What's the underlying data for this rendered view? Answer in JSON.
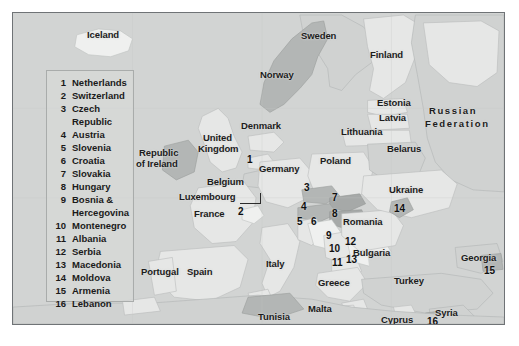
{
  "figure": {
    "type": "reference-map",
    "region": "Europe, North Africa and Western Asia",
    "frame_color": "#6f7376",
    "sea_color": "#d2d4d3",
    "land_light_color": "#e4e5e4",
    "land_mid_color": "#cfd1d0",
    "land_dark_color": "#b4b7b6",
    "label_color": "#1c1c1c"
  },
  "legend": {
    "border_color": "#a9acab",
    "entries": [
      {
        "number": "1",
        "name": "Netherlands",
        "continuation": ""
      },
      {
        "number": "2",
        "name": "Switzerland",
        "continuation": ""
      },
      {
        "number": "3",
        "name": "Czech",
        "continuation": "Republic"
      },
      {
        "number": "4",
        "name": "Austria",
        "continuation": ""
      },
      {
        "number": "5",
        "name": "Slovenia",
        "continuation": ""
      },
      {
        "number": "6",
        "name": "Croatia",
        "continuation": ""
      },
      {
        "number": "7",
        "name": "Slovakia",
        "continuation": ""
      },
      {
        "number": "8",
        "name": "Hungary",
        "continuation": ""
      },
      {
        "number": "9",
        "name": "Bosnia &",
        "continuation": "Hercegovina"
      },
      {
        "number": "10",
        "name": "Montenegro",
        "continuation": ""
      },
      {
        "number": "11",
        "name": "Albania",
        "continuation": ""
      },
      {
        "number": "12",
        "name": "Serbia",
        "continuation": ""
      },
      {
        "number": "13",
        "name": "Macedonia",
        "continuation": ""
      },
      {
        "number": "14",
        "name": "Moldova",
        "continuation": ""
      },
      {
        "number": "15",
        "name": "Armenia",
        "continuation": ""
      },
      {
        "number": "16",
        "name": "Lebanon",
        "continuation": ""
      }
    ]
  },
  "map_labels": [
    {
      "text": "Iceland",
      "x": 86,
      "y": 29,
      "wide": false
    },
    {
      "text": "Sweden",
      "x": 300,
      "y": 30,
      "wide": false
    },
    {
      "text": "Finland",
      "x": 369,
      "y": 49,
      "wide": false
    },
    {
      "text": "Norway",
      "x": 259,
      "y": 69,
      "wide": false
    },
    {
      "text": "Estonia",
      "x": 376,
      "y": 97,
      "wide": false
    },
    {
      "text": "Latvia",
      "x": 378,
      "y": 112,
      "wide": false
    },
    {
      "text": "Russian",
      "x": 428,
      "y": 105,
      "wide": true
    },
    {
      "text": "Federation",
      "x": 424,
      "y": 118,
      "wide": true
    },
    {
      "text": "Denmark",
      "x": 240,
      "y": 120,
      "wide": false
    },
    {
      "text": "Lithuania",
      "x": 340,
      "y": 126,
      "wide": false
    },
    {
      "text": "Belarus",
      "x": 386,
      "y": 143,
      "wide": false
    },
    {
      "text": "United",
      "x": 202,
      "y": 132,
      "wide": false
    },
    {
      "text": "Kingdom",
      "x": 197,
      "y": 143,
      "wide": false
    },
    {
      "text": "Republic",
      "x": 138,
      "y": 147,
      "wide": false
    },
    {
      "text": "of Ireland",
      "x": 135,
      "y": 158,
      "wide": false
    },
    {
      "text": "Germany",
      "x": 258,
      "y": 163,
      "wide": false
    },
    {
      "text": "Poland",
      "x": 319,
      "y": 155,
      "wide": false
    },
    {
      "text": "Belgium",
      "x": 206,
      "y": 176,
      "wide": false
    },
    {
      "text": "Luxembourg",
      "x": 178,
      "y": 191,
      "wide": false
    },
    {
      "text": "France",
      "x": 193,
      "y": 208,
      "wide": false
    },
    {
      "text": "Ukraine",
      "x": 388,
      "y": 184,
      "wide": false
    },
    {
      "text": "Romania",
      "x": 342,
      "y": 216,
      "wide": false
    },
    {
      "text": "Italy",
      "x": 265,
      "y": 258,
      "wide": false
    },
    {
      "text": "Bulgaria",
      "x": 352,
      "y": 247,
      "wide": false
    },
    {
      "text": "Georgia",
      "x": 460,
      "y": 252,
      "wide": false
    },
    {
      "text": "Greece",
      "x": 317,
      "y": 277,
      "wide": false
    },
    {
      "text": "Turkey",
      "x": 393,
      "y": 275,
      "wide": false
    },
    {
      "text": "Portugal",
      "x": 140,
      "y": 266,
      "wide": false
    },
    {
      "text": "Spain",
      "x": 186,
      "y": 266,
      "wide": false
    },
    {
      "text": "Tunisia",
      "x": 257,
      "y": 311,
      "wide": false
    },
    {
      "text": "Malta",
      "x": 307,
      "y": 303,
      "wide": false
    },
    {
      "text": "Cyprus",
      "x": 380,
      "y": 314,
      "wide": false
    },
    {
      "text": "Syria",
      "x": 434,
      "y": 307,
      "wide": false
    }
  ],
  "map_numbers": [
    {
      "text": "1",
      "x": 246,
      "y": 154
    },
    {
      "text": "2",
      "x": 237,
      "y": 206
    },
    {
      "text": "3",
      "x": 303,
      "y": 182
    },
    {
      "text": "4",
      "x": 300,
      "y": 201
    },
    {
      "text": "5",
      "x": 296,
      "y": 216
    },
    {
      "text": "6",
      "x": 310,
      "y": 216
    },
    {
      "text": "7",
      "x": 331,
      "y": 192
    },
    {
      "text": "8",
      "x": 331,
      "y": 208
    },
    {
      "text": "9",
      "x": 325,
      "y": 230
    },
    {
      "text": "10",
      "x": 328,
      "y": 243
    },
    {
      "text": "11",
      "x": 331,
      "y": 257
    },
    {
      "text": "12",
      "x": 344,
      "y": 236
    },
    {
      "text": "13",
      "x": 345,
      "y": 254
    },
    {
      "text": "14",
      "x": 393,
      "y": 203
    },
    {
      "text": "15",
      "x": 483,
      "y": 265
    },
    {
      "text": "16",
      "x": 426,
      "y": 316
    }
  ]
}
